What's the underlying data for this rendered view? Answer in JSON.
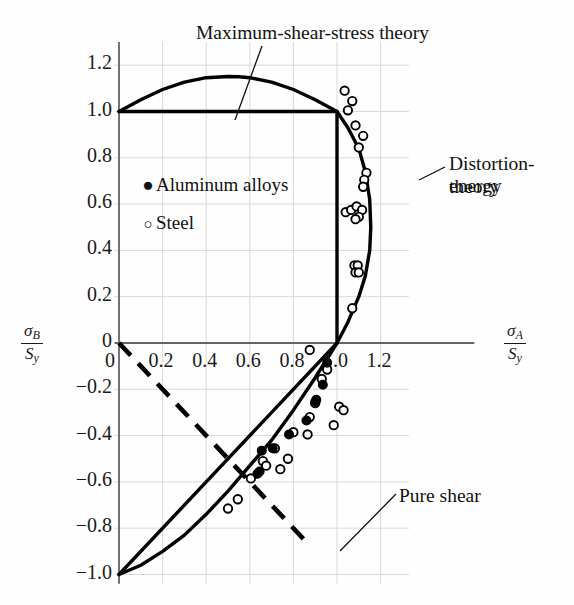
{
  "figure": {
    "axis_labels": {
      "y_numerator": "σ",
      "y_numerator_sub": "B",
      "y_denominator": "S",
      "y_denominator_sub": "y",
      "x_numerator": "σ",
      "x_numerator_sub": "A",
      "x_denominator": "S",
      "x_denominator_sub": "y"
    },
    "annotations": {
      "max_shear": "Maximum-shear-stress theory",
      "distortion_energy_line1": "Distortion-energy",
      "distortion_energy_line2": "theory",
      "pure_shear": "Pure shear"
    },
    "legend": [
      {
        "marker": "filled-circle-marker",
        "glyph": "●",
        "label": "Aluminum alloys"
      },
      {
        "marker": "open-circle-marker",
        "glyph": "○",
        "label": "Steel"
      }
    ]
  },
  "chart_data": {
    "type": "scatter",
    "title": "",
    "xlabel": "σA/Sy",
    "ylabel": "σB/Sy",
    "xlim": [
      -0.08,
      1.35
    ],
    "ylim": [
      -1.05,
      1.3
    ],
    "xticks": [
      "0",
      "0.2",
      "0.4",
      "0.6",
      "0.8",
      "1.0",
      "1.2"
    ],
    "xtick_values": [
      0,
      0.2,
      0.4,
      0.6,
      0.8,
      1.0,
      1.2
    ],
    "yticks": [
      "1.2",
      "1.0",
      "0.8",
      "0.6",
      "0.4",
      "0.2",
      "0",
      "−0.2",
      "−0.4",
      "−0.6",
      "−0.8",
      "−1.0"
    ],
    "ytick_values": [
      1.2,
      1.0,
      0.8,
      0.6,
      0.4,
      0.2,
      0,
      -0.2,
      -0.4,
      -0.6,
      -0.8,
      -1.0
    ],
    "grid": true,
    "legend_position": "upper-left-inside",
    "curves": [
      {
        "name": "distortion-energy-theory",
        "style": "solid",
        "description": "von Mises ellipse sA^2 - sA*sB + sB^2 = 1, quadrants I and IV portion shown",
        "points": [
          [
            0.0,
            1.0
          ],
          [
            0.1,
            1.051
          ],
          [
            0.2,
            1.095
          ],
          [
            0.3,
            1.127
          ],
          [
            0.4,
            1.146
          ],
          [
            0.5,
            1.151
          ],
          [
            0.55,
            1.15
          ],
          [
            0.6,
            1.146
          ],
          [
            0.7,
            1.127
          ],
          [
            0.8,
            1.095
          ],
          [
            0.9,
            1.051
          ],
          [
            1.0,
            1.0
          ],
          [
            1.05,
            0.93
          ],
          [
            1.1,
            0.84
          ],
          [
            1.13,
            0.74
          ],
          [
            1.15,
            0.62
          ],
          [
            1.155,
            0.5
          ],
          [
            1.15,
            0.4
          ],
          [
            1.13,
            0.29
          ],
          [
            1.1,
            0.2
          ],
          [
            1.05,
            0.09
          ],
          [
            1.0,
            0.0
          ],
          [
            0.9,
            -0.15
          ],
          [
            0.8,
            -0.29
          ],
          [
            0.7,
            -0.42
          ],
          [
            0.6,
            -0.53
          ],
          [
            0.5,
            -0.64
          ],
          [
            0.4,
            -0.74
          ],
          [
            0.3,
            -0.83
          ],
          [
            0.2,
            -0.9
          ],
          [
            0.1,
            -0.96
          ],
          [
            0.0,
            -1.0
          ]
        ]
      },
      {
        "name": "maximum-shear-stress-theory",
        "style": "solid",
        "description": "Tresca hexagon: horizontal at sB=1.0 for 0<=sA<=1.0, vertical at sA=1.0 for 0<=sB<=1.0, and line sA-sB=1 in fourth quadrant",
        "segments": [
          [
            [
              0.0,
              1.0
            ],
            [
              1.0,
              1.0
            ]
          ],
          [
            [
              1.0,
              1.0
            ],
            [
              1.0,
              0.0
            ]
          ],
          [
            [
              1.0,
              0.0
            ],
            [
              0.0,
              -1.0
            ]
          ]
        ]
      },
      {
        "name": "pure-shear-line",
        "style": "dashed",
        "description": "Pure shear load line sB = -sA through origin",
        "segments": [
          [
            [
              0.0,
              0.0
            ],
            [
              0.86,
              -0.86
            ]
          ]
        ]
      }
    ],
    "series": [
      {
        "name": "Steel",
        "marker": "open-circle",
        "points": [
          [
            1.07,
            1.045
          ],
          [
            1.035,
            1.09
          ],
          [
            1.05,
            1.005
          ],
          [
            1.085,
            0.94
          ],
          [
            1.12,
            0.895
          ],
          [
            1.1,
            0.845
          ],
          [
            1.135,
            0.735
          ],
          [
            1.125,
            0.705
          ],
          [
            1.12,
            0.675
          ],
          [
            1.04,
            0.565
          ],
          [
            1.065,
            0.575
          ],
          [
            1.09,
            0.59
          ],
          [
            1.115,
            0.575
          ],
          [
            1.1,
            0.545
          ],
          [
            1.085,
            0.535
          ],
          [
            1.08,
            0.335
          ],
          [
            1.095,
            0.335
          ],
          [
            1.085,
            0.305
          ],
          [
            1.1,
            0.305
          ],
          [
            1.07,
            0.15
          ],
          [
            0.875,
            -0.03
          ],
          [
            0.955,
            -0.115
          ],
          [
            0.93,
            -0.155
          ],
          [
            0.9,
            -0.26
          ],
          [
            1.01,
            -0.275
          ],
          [
            1.03,
            -0.29
          ],
          [
            0.875,
            -0.32
          ],
          [
            0.985,
            -0.355
          ],
          [
            0.8,
            -0.385
          ],
          [
            0.865,
            -0.395
          ],
          [
            0.715,
            -0.455
          ],
          [
            0.775,
            -0.5
          ],
          [
            0.66,
            -0.51
          ],
          [
            0.675,
            -0.53
          ],
          [
            0.74,
            -0.545
          ],
          [
            0.605,
            -0.585
          ],
          [
            0.545,
            -0.675
          ],
          [
            0.5,
            -0.715
          ]
        ]
      },
      {
        "name": "Aluminum alloys",
        "marker": "filled-circle",
        "points": [
          [
            0.955,
            -0.085
          ],
          [
            0.935,
            -0.18
          ],
          [
            0.905,
            -0.245
          ],
          [
            0.9,
            -0.255
          ],
          [
            0.86,
            -0.335
          ],
          [
            0.78,
            -0.395
          ],
          [
            0.705,
            -0.455
          ],
          [
            0.655,
            -0.465
          ],
          [
            0.645,
            -0.555
          ],
          [
            0.635,
            -0.565
          ]
        ]
      }
    ]
  }
}
